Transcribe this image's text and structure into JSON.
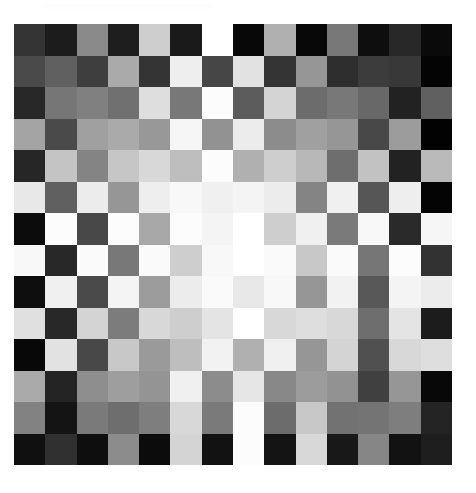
{
  "figure": {
    "background_color": "#ffffff",
    "plot_area": {
      "left_px": 14,
      "top_px": 24,
      "width_px": 438,
      "height_px": 441
    }
  },
  "header": {
    "faint_text": ""
  },
  "chart_data": {
    "type": "heatmap",
    "subtitle": "",
    "xlabel": "",
    "ylabel": "",
    "grid": false,
    "legend": "none",
    "colormap": "grayscale",
    "value_range": [
      0,
      255
    ],
    "rows": 14,
    "cols": 14,
    "cell_width_px": 31.29,
    "cell_height_px": 31.5,
    "x": [
      1,
      2,
      3,
      4,
      5,
      6,
      7,
      8,
      9,
      10,
      11,
      12,
      13,
      14
    ],
    "y": [
      1,
      2,
      3,
      4,
      5,
      6,
      7,
      8,
      9,
      10,
      11,
      12,
      13,
      14
    ],
    "xticklabels": [],
    "yticklabels": [],
    "values": [
      [
        52,
        28,
        138,
        30,
        206,
        26,
        255,
        8,
        176,
        8,
        120,
        14,
        40,
        10
      ],
      [
        74,
        96,
        62,
        170,
        52,
        238,
        70,
        226,
        52,
        150,
        46,
        60,
        56,
        4
      ],
      [
        40,
        118,
        128,
        112,
        222,
        120,
        252,
        92,
        212,
        108,
        120,
        104,
        34,
        96
      ],
      [
        164,
        74,
        160,
        170,
        152,
        246,
        146,
        236,
        140,
        160,
        150,
        72,
        156,
        2
      ],
      [
        38,
        196,
        132,
        198,
        216,
        190,
        252,
        176,
        206,
        184,
        110,
        194,
        34,
        186
      ],
      [
        232,
        96,
        236,
        150,
        238,
        248,
        240,
        244,
        236,
        132,
        240,
        86,
        238,
        4
      ],
      [
        12,
        252,
        72,
        252,
        168,
        252,
        244,
        255,
        206,
        240,
        122,
        248,
        42,
        246
      ],
      [
        248,
        40,
        250,
        120,
        250,
        206,
        248,
        255,
        250,
        200,
        250,
        118,
        252,
        50
      ],
      [
        14,
        240,
        74,
        244,
        156,
        236,
        250,
        232,
        248,
        150,
        242,
        88,
        244,
        236
      ],
      [
        224,
        40,
        212,
        124,
        216,
        206,
        228,
        255,
        216,
        222,
        216,
        110,
        228,
        28
      ],
      [
        8,
        226,
        72,
        200,
        154,
        190,
        242,
        176,
        240,
        150,
        212,
        80,
        216,
        222
      ],
      [
        170,
        36,
        142,
        158,
        148,
        240,
        140,
        230,
        136,
        156,
        146,
        64,
        150,
        8
      ],
      [
        130,
        20,
        122,
        110,
        126,
        216,
        122,
        252,
        108,
        200,
        114,
        116,
        126,
        36
      ],
      [
        16,
        48,
        14,
        140,
        12,
        212,
        18,
        252,
        20,
        216,
        24,
        134,
        18,
        30
      ]
    ]
  }
}
